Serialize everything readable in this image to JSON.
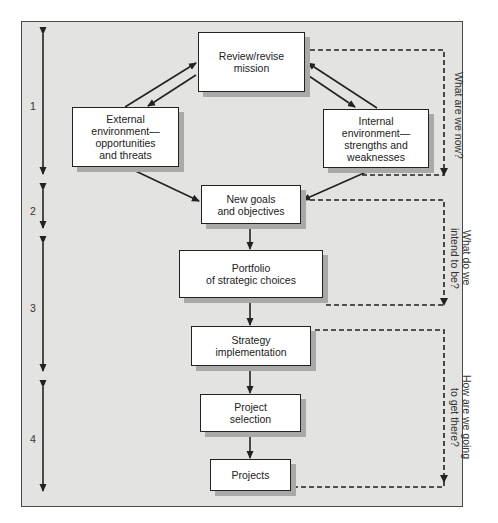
{
  "diagram": {
    "boxes": {
      "mission": "Review/revise\nmission",
      "external": "External\nenvironment—\nopportunities\nand threats",
      "internal": "Internal\nenvironment—\nstrengths and\nweaknesses",
      "goals": "New goals\nand objectives",
      "portfolio": "Portfolio\nof strategic choices",
      "implementation": "Strategy\nimplementation",
      "selection": "Project\nselection",
      "projects": "Projects"
    },
    "stages": [
      {
        "label": "1"
      },
      {
        "label": "2"
      },
      {
        "label": "3"
      },
      {
        "label": "4"
      }
    ],
    "questions": [
      {
        "text": "What are we now?"
      },
      {
        "text": "What do we\nintend to be?"
      },
      {
        "text": "How are we going\nto get there?"
      }
    ],
    "colors": {
      "background": "#e3e3e1",
      "box": "#ffffff",
      "shadow": "#a9a9a7",
      "line": "#222222"
    }
  }
}
